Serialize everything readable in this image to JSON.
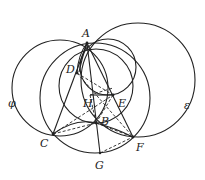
{
  "diagram": {
    "type": "geometry-construction",
    "stroke_color": "#222222",
    "points": {
      "A": {
        "label": "A",
        "x": 87,
        "y": 43
      },
      "D": {
        "label": "D",
        "x": 77,
        "y": 73
      },
      "H": {
        "label": "H",
        "x": 90,
        "y": 95
      },
      "E": {
        "label": "E",
        "x": 113,
        "y": 95
      },
      "B": {
        "label": "B",
        "x": 96,
        "y": 123
      },
      "C": {
        "label": "C",
        "x": 53,
        "y": 134
      },
      "F": {
        "label": "F",
        "x": 133,
        "y": 137
      },
      "G": {
        "label": "G",
        "x": 100,
        "y": 153
      }
    },
    "circle_labels": {
      "phi": "φ",
      "epsilon": "ε"
    }
  }
}
